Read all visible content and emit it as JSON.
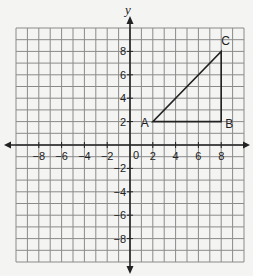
{
  "axes": {
    "x_label": "",
    "y_label": "y",
    "origin_label": "0",
    "x_ticks": [
      "−8",
      "−6",
      "−4",
      "−2",
      "2",
      "4",
      "6",
      "8"
    ],
    "x_tick_values": [
      -8,
      -6,
      -4,
      -2,
      2,
      4,
      6,
      8
    ],
    "y_ticks": [
      "8",
      "6",
      "4",
      "2",
      "−2",
      "−4",
      "−6",
      "−8"
    ],
    "y_tick_values": [
      8,
      6,
      4,
      2,
      -2,
      -4,
      -6,
      -8
    ],
    "range": [
      -10,
      10
    ]
  },
  "triangle": {
    "points": [
      {
        "label": "A",
        "x": 2,
        "y": 2
      },
      {
        "label": "B",
        "x": 8,
        "y": 2
      },
      {
        "label": "C",
        "x": 8,
        "y": 8
      }
    ]
  },
  "colors": {
    "grid": "#8a8a8a",
    "axis": "#222222",
    "shape": "#222222",
    "background": "#f4f4f2"
  }
}
